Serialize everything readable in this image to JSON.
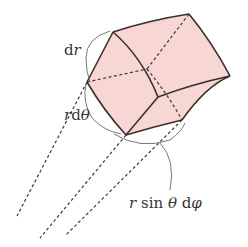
{
  "diagram": {
    "colors": {
      "fill": "#f7d6d3",
      "edge": "#3a3030",
      "dashed": "#3a3a3a",
      "annotation": "#6a6666",
      "text": "#3a3333"
    },
    "labels": {
      "dr": "dr",
      "r_dtheta": "rdθ",
      "r_sin_theta_dphi": "r sin θ dφ"
    },
    "label_parts": {
      "dr": {
        "d": "d",
        "r": "r"
      },
      "r_dtheta": {
        "r": "r",
        "d": "d",
        "theta": "θ"
      },
      "r_sin_theta_dphi": {
        "r": "r",
        "sin": " sin ",
        "theta": "θ",
        "space": " ",
        "d": "d",
        "phi": "φ"
      }
    }
  }
}
